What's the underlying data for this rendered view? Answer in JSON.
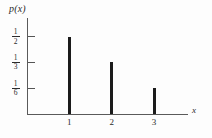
{
  "figure": {
    "background_color": "#fdfdfd",
    "axis_color": "#5a5a5a",
    "bar_color": "#1b1b1b",
    "y_axis_name": "p(x)",
    "x_axis_name": "x"
  },
  "chart_data": {
    "type": "bar",
    "title": "",
    "subtitle": "",
    "xlabel": "x",
    "ylabel": "p(x)",
    "categories": [
      "1",
      "2",
      "3"
    ],
    "x": [
      1,
      2,
      3
    ],
    "values": [
      0.5,
      0.3333,
      0.1667
    ],
    "value_labels": [
      "1/2",
      "1/3",
      "1/6"
    ],
    "xlim": [
      0,
      3.8
    ],
    "ylim": [
      0,
      0.62
    ],
    "xticks": [
      1,
      2,
      3
    ],
    "xticklabels": [
      "1",
      "2",
      "3"
    ],
    "yticks": [
      0.5,
      0.3333,
      0.1667
    ],
    "yticklabels": [
      {
        "numerator": "1",
        "denominator": "2"
      },
      {
        "numerator": "1",
        "denominator": "3"
      },
      {
        "numerator": "1",
        "denominator": "6"
      }
    ],
    "grid": false,
    "legend": null,
    "annotations": [],
    "style": "impulse/stem bars on bare axes"
  },
  "geometry": {
    "y_tick_y_px": [
      52,
      70,
      88
    ],
    "x_tick_x_px": [
      62,
      105,
      148
    ],
    "baseline_y_px": 114,
    "bar_tops_y_px": [
      52,
      70,
      88
    ]
  }
}
